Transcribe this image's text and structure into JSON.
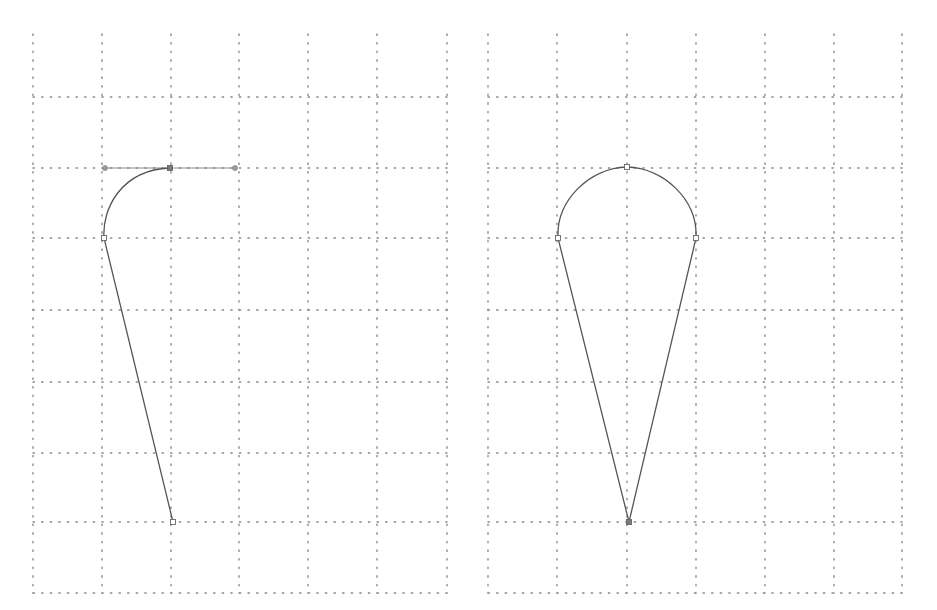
{
  "panels": [
    {
      "id": "left",
      "grid": {
        "x_lines": [
          33,
          102,
          171,
          239,
          308,
          377,
          447
        ],
        "y_lines": [
          97,
          168,
          238,
          310,
          382,
          453,
          522,
          593
        ],
        "top": 34,
        "bottom": 593
      },
      "path": {
        "description": "Half drop shape being drawn with pen tool, top curve with active bezier handles",
        "d": "M 173 522 L 104 238 C 102 210 120 170 170 168",
        "anchors": [
          {
            "x": 173,
            "y": 522,
            "type": "open"
          },
          {
            "x": 104,
            "y": 238,
            "type": "open"
          },
          {
            "x": 170,
            "y": 168,
            "type": "selected"
          }
        ],
        "handles": [
          {
            "x1": 104,
            "y1": 168,
            "x2": 236,
            "y2": 168
          }
        ],
        "handle_points": [
          {
            "x": 105,
            "y": 168
          },
          {
            "x": 235,
            "y": 168
          }
        ]
      }
    },
    {
      "id": "right",
      "grid": {
        "x_lines": [
          488,
          557,
          627,
          696,
          765,
          834,
          902
        ],
        "y_lines": [
          97,
          168,
          238,
          310,
          382,
          453,
          522,
          593
        ],
        "top": 34,
        "bottom": 593
      },
      "path": {
        "description": "Completed teardrop / ice cream cone shape",
        "d": "M 629 522 L 558 238 C 556 200 590 168 627 167 C 664 168 698 200 696 238 Z",
        "anchors": [
          {
            "x": 629,
            "y": 522,
            "type": "selected"
          },
          {
            "x": 558,
            "y": 238,
            "type": "open"
          },
          {
            "x": 627,
            "y": 167,
            "type": "open"
          },
          {
            "x": 696,
            "y": 238,
            "type": "open"
          }
        ],
        "handles": [],
        "handle_points": []
      }
    }
  ]
}
